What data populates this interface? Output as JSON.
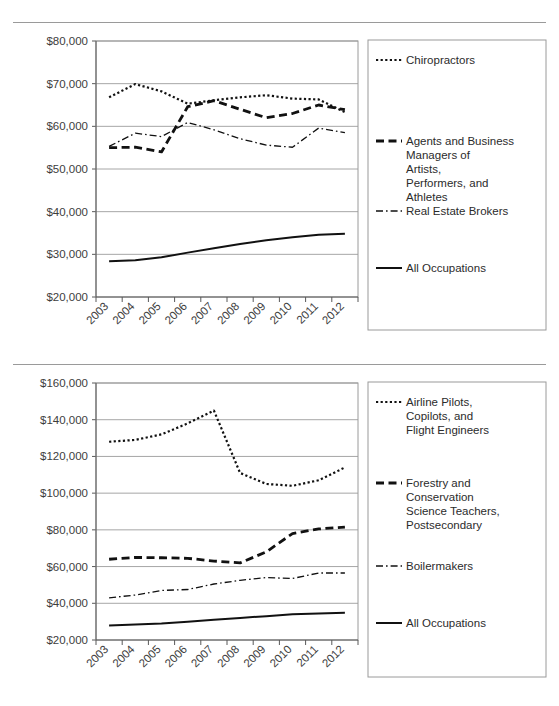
{
  "page": {
    "title_cut_off": "",
    "background": "#ffffff",
    "line_color": "#111111",
    "grid_color": "#a6a6a6",
    "frame_color": "#9a9a9a"
  },
  "chart_data": [
    {
      "id": "chart-top",
      "type": "line",
      "title": "",
      "xlabel": "",
      "ylabel": "",
      "x": [
        "2003",
        "2004",
        "2005",
        "2006",
        "2007",
        "2008",
        "2009",
        "2010",
        "2011",
        "2012"
      ],
      "ylim": [
        20000,
        80000
      ],
      "yticks": [
        20000,
        30000,
        40000,
        50000,
        60000,
        70000,
        80000
      ],
      "ytick_labels": [
        "$20,000",
        "$30,000",
        "$40,000",
        "$50,000",
        "$60,000",
        "$70,000",
        "$80,000"
      ],
      "grid": true,
      "legend_position": "right",
      "series": [
        {
          "name": "Chiropractors",
          "dash": "dotted",
          "values": [
            66800,
            69900,
            68200,
            65300,
            66100,
            66800,
            67300,
            66500,
            66300,
            63300
          ]
        },
        {
          "name": "Agents and Business Managers of Artists, Performers, and Athletes",
          "dash": "dashed",
          "values": [
            55000,
            55100,
            54000,
            64600,
            66000,
            64000,
            62000,
            63000,
            65000,
            63900
          ]
        },
        {
          "name": "Real Estate Brokers",
          "dash": "dashdot",
          "values": [
            55300,
            58400,
            57600,
            60900,
            59200,
            57100,
            55600,
            55100,
            59600,
            58500
          ]
        },
        {
          "name": "All Occupations",
          "dash": "solid",
          "values": [
            28400,
            28600,
            29300,
            30400,
            31400,
            32400,
            33300,
            34000,
            34600,
            34800
          ]
        }
      ]
    },
    {
      "id": "chart-bottom",
      "type": "line",
      "title": "",
      "xlabel": "",
      "ylabel": "",
      "x": [
        "2003",
        "2004",
        "2005",
        "2006",
        "2007",
        "2008",
        "2009",
        "2010",
        "2011",
        "2012"
      ],
      "ylim": [
        20000,
        160000
      ],
      "yticks": [
        20000,
        40000,
        60000,
        80000,
        100000,
        120000,
        140000,
        160000
      ],
      "ytick_labels": [
        "$20,000",
        "$40,000",
        "$60,000",
        "$80,000",
        "$100,000",
        "$120,000",
        "$140,000",
        "$160,000"
      ],
      "grid": true,
      "legend_position": "right",
      "series": [
        {
          "name": "Airline Pilots, Copilots, and Flight Engineers",
          "dash": "dotted",
          "values": [
            128000,
            129000,
            132000,
            138000,
            145000,
            111000,
            105000,
            104000,
            107000,
            114000
          ]
        },
        {
          "name": "Forestry and Conservation Science Teachers, Postsecondary",
          "dash": "dashed",
          "values": [
            64000,
            65000,
            64800,
            64500,
            63000,
            62000,
            68000,
            78000,
            80500,
            81500
          ]
        },
        {
          "name": "Boilermakers",
          "dash": "dashdot",
          "values": [
            43000,
            44500,
            47000,
            47500,
            50500,
            52500,
            54000,
            53500,
            56500,
            56500
          ]
        },
        {
          "name": "All Occupations",
          "dash": "solid",
          "values": [
            27900,
            28400,
            29000,
            30000,
            31000,
            32000,
            33000,
            34000,
            34500,
            34800
          ]
        }
      ]
    }
  ],
  "legends": {
    "chart-top": [
      {
        "label": "Chiropractors",
        "dash": "dotted"
      },
      {
        "label": "Agents and Business Managers of Artists, Performers, and Athletes",
        "dash": "dashed"
      },
      {
        "label": "Real Estate Brokers",
        "dash": "dashdot"
      },
      {
        "label": "All Occupations",
        "dash": "solid"
      }
    ],
    "chart-bottom": [
      {
        "label": "Airline Pilots, Copilots, and Flight Engineers",
        "dash": "dotted"
      },
      {
        "label": "Forestry and Conservation Science Teachers, Postsecondary",
        "dash": "dashed"
      },
      {
        "label": "Boilermakers",
        "dash": "dashdot"
      },
      {
        "label": "All Occupations",
        "dash": "solid"
      }
    ]
  }
}
